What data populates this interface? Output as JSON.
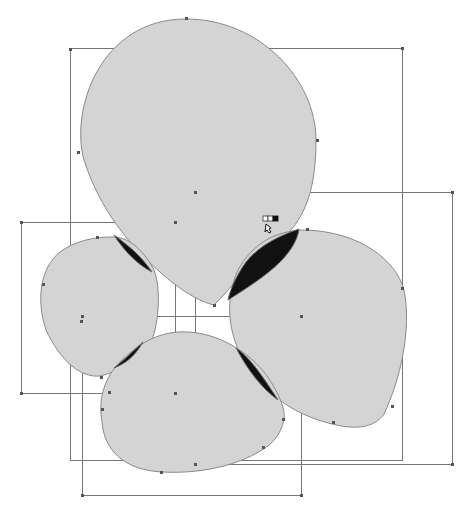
{
  "canvas": {
    "background": "#ffffff",
    "shape_fill": "#d4d4d4",
    "shape_stroke": "#8a8a8a",
    "overlap_fill": "#111111",
    "bbox_stroke": "#777777",
    "anchor_color": "#555555"
  },
  "shapes": [
    {
      "name": "top-blob"
    },
    {
      "name": "left-blob"
    },
    {
      "name": "right-blob"
    },
    {
      "name": "bottom-blob"
    }
  ],
  "bounding_boxes": [
    {
      "name": "top-blob-bbox",
      "x": 70,
      "y": 48,
      "w": 332,
      "h": 412
    },
    {
      "name": "right-blob-bbox",
      "x": 195,
      "y": 192,
      "w": 257,
      "h": 272
    },
    {
      "name": "left-blob-bbox",
      "x": 21,
      "y": 222,
      "w": 154,
      "h": 171
    },
    {
      "name": "bottom-blob-bbox",
      "x": 82,
      "y": 316,
      "w": 219,
      "h": 179
    }
  ],
  "cursor": {
    "name": "pointer-with-swatch",
    "x": 263,
    "y": 216
  }
}
